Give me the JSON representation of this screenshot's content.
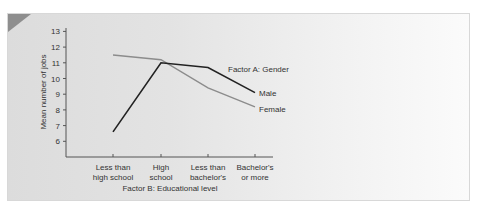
{
  "chart_data": {
    "type": "line",
    "title": "",
    "xlabel": "Factor B: Educational level",
    "ylabel": "Mean number of jobs",
    "categories": [
      "Less than high school",
      "High school",
      "Less than bachelor's",
      "Bachelor's or more"
    ],
    "category_lines": [
      [
        "Less than",
        "high school"
      ],
      [
        "High",
        "school"
      ],
      [
        "Less than",
        "bachelor's"
      ],
      [
        "Bachelor's",
        "or more"
      ]
    ],
    "legend_title": "Factor A: Gender",
    "series": [
      {
        "name": "Male",
        "values": [
          6.6,
          11.0,
          10.7,
          9.1
        ],
        "color": "#222222"
      },
      {
        "name": "Female",
        "values": [
          11.5,
          11.2,
          9.4,
          8.2
        ],
        "color": "#8c8c8c"
      }
    ],
    "yticks": [
      6,
      7,
      8,
      9,
      10,
      11,
      12,
      13
    ],
    "ylim": [
      5,
      13.3
    ],
    "grid": false,
    "legend_position": "inline-right"
  }
}
